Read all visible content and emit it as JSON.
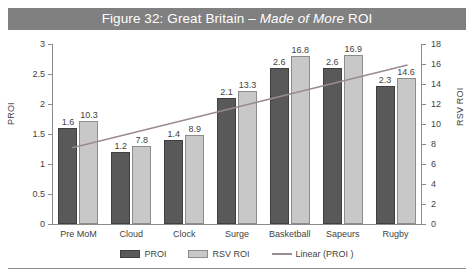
{
  "figure": {
    "title_prefix": "Figure 32: Great Britain – ",
    "title_emphasis": "Made of More",
    "title_suffix": " ROI",
    "title_full": "Figure 32: Great Britain – Made of More ROI",
    "band_color": "#808080",
    "title_color": "#ffffff"
  },
  "chart_data": {
    "type": "bar",
    "title": "Figure 32: Great Britain – Made of More ROI",
    "xlabel": "",
    "ylabel": "PROI",
    "y2label": "RSV ROI",
    "categories": [
      "Pre MoM",
      "Cloud",
      "Clock",
      "Surge",
      "Basketball",
      "Sapeurs",
      "Rugby"
    ],
    "series": [
      {
        "name": "PROI",
        "axis": "left",
        "color": "#595959",
        "values": [
          1.6,
          1.2,
          1.4,
          2.1,
          2.6,
          2.6,
          2.3
        ],
        "labels": [
          "1.6",
          "1.2",
          "1.4",
          "2.1",
          "2.6",
          "2.6",
          "2.3"
        ]
      },
      {
        "name": "RSV ROI",
        "axis": "right",
        "color": "#c8c8c8",
        "values": [
          10.3,
          7.8,
          8.9,
          13.3,
          16.8,
          16.9,
          14.6
        ],
        "labels": [
          "10.3",
          "7.8",
          "8.9",
          "13.3",
          "16.8",
          "16.9",
          "14.6"
        ]
      }
    ],
    "trendline": {
      "name": "Linear (PROI )",
      "color": "#9b8a93",
      "axis": "left",
      "start_value": 1.27,
      "end_value": 2.65
    },
    "ylim": [
      0,
      3
    ],
    "yticks": [
      0,
      0.5,
      1,
      1.5,
      2,
      2.5,
      3
    ],
    "ytick_labels": [
      "0",
      "0.5",
      "1",
      "1.5",
      "2",
      "2.5",
      "3"
    ],
    "y2lim": [
      0,
      18
    ],
    "y2ticks": [
      0,
      2,
      4,
      6,
      8,
      10,
      12,
      14,
      16,
      18
    ],
    "y2tick_labels": [
      "0",
      "2",
      "4",
      "6",
      "8",
      "10",
      "12",
      "14",
      "16",
      "18"
    ],
    "grid": false,
    "legend_position": "bottom"
  },
  "legend": {
    "items": [
      {
        "label": "PROI",
        "kind": "proi"
      },
      {
        "label": "RSV ROI",
        "kind": "rsv"
      },
      {
        "label": "Linear (PROI )",
        "kind": "line"
      }
    ]
  }
}
